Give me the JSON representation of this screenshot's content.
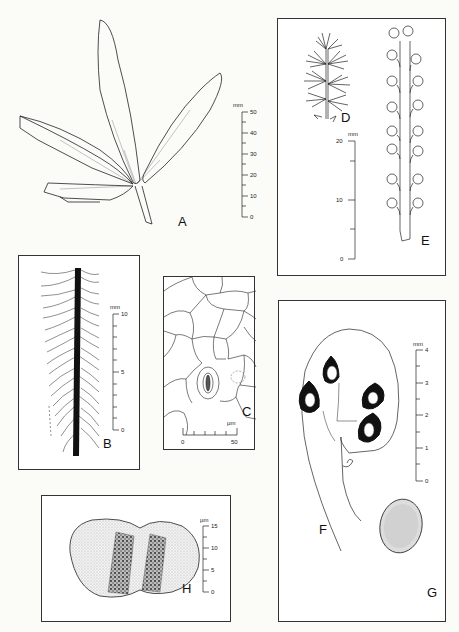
{
  "plate": {
    "figures": [
      {
        "id": "A",
        "label": "A",
        "description": "compound leaf with five leaflets",
        "scale": {
          "unit": "mm",
          "ticks": [
            "50",
            "40",
            "30",
            "20",
            "10",
            "0"
          ]
        }
      },
      {
        "id": "B",
        "label": "B",
        "description": "leaflet venation detail",
        "scale": {
          "unit": "mm",
          "ticks": [
            "10",
            "5",
            "0"
          ]
        }
      },
      {
        "id": "C",
        "label": "C",
        "description": "epidermal cells with stoma",
        "scale": {
          "unit": "µm",
          "ticks": [
            "0",
            "50"
          ]
        }
      },
      {
        "id": "D",
        "label": "D",
        "description": "male inflorescence"
      },
      {
        "id": "E",
        "label": "E",
        "description": "female inflorescence with ovules",
        "scale": {
          "unit": "mm",
          "ticks": [
            "20",
            "10",
            "0"
          ]
        }
      },
      {
        "id": "F",
        "label": "F",
        "description": "sectioned cone scale with seeds",
        "scale": {
          "unit": "mm",
          "ticks": [
            "4",
            "3",
            "2",
            "1",
            "0"
          ]
        }
      },
      {
        "id": "G",
        "label": "G",
        "description": "seed"
      },
      {
        "id": "H",
        "label": "H",
        "description": "pollen grain",
        "scale": {
          "unit": "µm",
          "ticks": [
            "15",
            "10",
            "5",
            "0"
          ]
        }
      }
    ]
  }
}
